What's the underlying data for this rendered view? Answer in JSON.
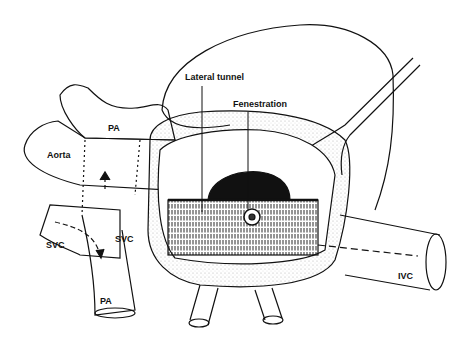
{
  "figure": {
    "colors": {
      "ink": "#111111",
      "background": "#ffffff"
    },
    "labels": {
      "lateral_tunnel": "Lateral tunnel",
      "fenestration": "Fenestration",
      "pa_upper": "PA",
      "aorta": "Aorta",
      "svc_left": "SVC",
      "svc_inner": "SVC",
      "pa_lower": "PA",
      "ivc": "IVC"
    }
  }
}
